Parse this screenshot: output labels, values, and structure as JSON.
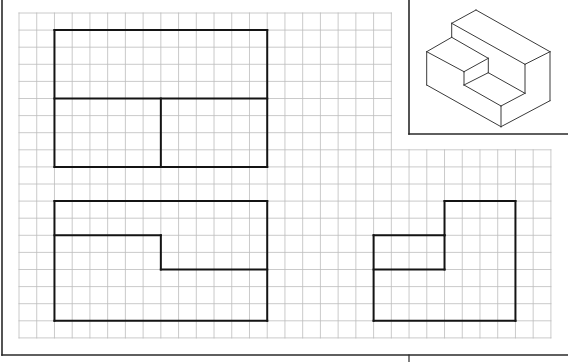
{
  "sheet": {
    "width": 568,
    "height": 362,
    "background": "#ffffff",
    "frame_color": "#2a2a2a",
    "grid_color": "#bdbdbd",
    "outline_color": "#141414",
    "iso_color": "#3a3a3a"
  },
  "frame": {
    "left_border": {
      "x": 2,
      "y1": 0,
      "y2": 355
    },
    "bottom_line": {
      "y": 355,
      "x1": 2,
      "x2": 568
    },
    "title_divider": {
      "x": 409,
      "y1": 355,
      "y2": 362
    }
  },
  "grid": {
    "x0": 19,
    "y0": 13,
    "cell_w": 17.73,
    "cell_h": 17.1,
    "cols": 30,
    "rows": 19,
    "upper_cols": 21,
    "upper_rows_cutoff": 8
  },
  "iso_frame": {
    "x": 409,
    "y": 0,
    "right": 568,
    "bottom": 134
  },
  "views": [
    {
      "name": "top-view",
      "label": "Top view",
      "segments": [
        [
          [
            2,
            1
          ],
          [
            14,
            1
          ]
        ],
        [
          [
            14,
            1
          ],
          [
            14,
            9
          ]
        ],
        [
          [
            14,
            9
          ],
          [
            2,
            9
          ]
        ],
        [
          [
            2,
            9
          ],
          [
            2,
            1
          ]
        ],
        [
          [
            2,
            5
          ],
          [
            14,
            5
          ]
        ],
        [
          [
            8,
            5
          ],
          [
            8,
            9
          ]
        ]
      ]
    },
    {
      "name": "front-view",
      "label": "Front view",
      "segments": [
        [
          [
            2,
            11
          ],
          [
            14,
            11
          ]
        ],
        [
          [
            14,
            11
          ],
          [
            14,
            18
          ]
        ],
        [
          [
            14,
            18
          ],
          [
            2,
            18
          ]
        ],
        [
          [
            2,
            18
          ],
          [
            2,
            11
          ]
        ],
        [
          [
            2,
            13
          ],
          [
            8,
            13
          ]
        ],
        [
          [
            8,
            13
          ],
          [
            8,
            15
          ]
        ],
        [
          [
            8,
            15
          ],
          [
            14,
            15
          ]
        ]
      ]
    },
    {
      "name": "side-view",
      "label": "Side view",
      "segments": [
        [
          [
            24,
            11
          ],
          [
            28,
            11
          ]
        ],
        [
          [
            28,
            11
          ],
          [
            28,
            18
          ]
        ],
        [
          [
            28,
            18
          ],
          [
            20,
            18
          ]
        ],
        [
          [
            20,
            18
          ],
          [
            20,
            13
          ]
        ],
        [
          [
            20,
            13
          ],
          [
            24,
            13
          ]
        ],
        [
          [
            24,
            13
          ],
          [
            24,
            11
          ]
        ],
        [
          [
            24,
            13
          ],
          [
            24,
            15
          ]
        ],
        [
          [
            20,
            15
          ],
          [
            24,
            15
          ]
        ]
      ]
    }
  ],
  "isometric": {
    "name": "isometric-block",
    "label": "Isometric view of stepped block",
    "lines": [
      [
        476,
        10,
        451.7,
        23.3
      ],
      [
        476,
        10,
        550,
        51.7
      ],
      [
        451.7,
        23.3,
        525,
        64.3
      ],
      [
        550,
        51.7,
        525,
        64.3
      ],
      [
        451.7,
        23.3,
        451.7,
        37.3
      ],
      [
        451.7,
        37.3,
        426.7,
        51.7
      ],
      [
        451.7,
        37.3,
        488.3,
        58.3
      ],
      [
        426.7,
        51.7,
        464,
        71.7
      ],
      [
        464,
        71.7,
        488.3,
        58.3
      ],
      [
        488.3,
        58.3,
        488.3,
        72.7
      ],
      [
        488.3,
        72.7,
        525,
        93.3
      ],
      [
        464,
        71.7,
        464,
        85
      ],
      [
        464,
        85,
        488.3,
        72.7
      ],
      [
        464,
        85,
        501,
        106
      ],
      [
        501,
        106,
        525,
        93.3
      ],
      [
        525,
        64.3,
        525,
        93.3
      ],
      [
        426.7,
        51.7,
        426.7,
        85
      ],
      [
        426.7,
        85,
        501,
        126.7
      ],
      [
        501,
        106,
        501,
        126.7
      ],
      [
        501,
        126.7,
        550,
        100.7
      ],
      [
        550,
        51.7,
        550,
        100.7
      ]
    ]
  }
}
